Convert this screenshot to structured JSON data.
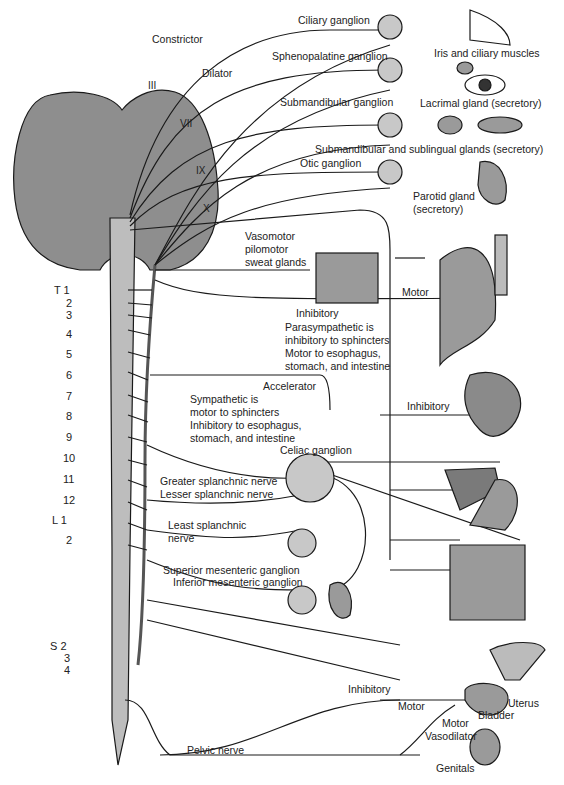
{
  "cranial_nerves": {
    "III": "III",
    "VII": "VII",
    "IX": "IX",
    "X": "X"
  },
  "labels": {
    "constrictor": "Constrictor",
    "dilator": "Dilator",
    "ciliary_ganglion": "Ciliary ganglion",
    "iris": "Iris and ciliary muscles",
    "sphenopalatine": "Sphenopalatine ganglion",
    "lacrimal": "Lacrimal gland (secretory)",
    "submandibular_ganglion": "Submandibular ganglion",
    "submandibular_glands": "Submandibular and sublingual glands (secretory)",
    "otic": "Otic ganglion",
    "parotid1": "Parotid gland",
    "parotid2": "(secretory)",
    "vaso1": "Vasomotor",
    "vaso2": "pilomotor",
    "vaso3": "sweat glands",
    "motor_lung": "Motor",
    "inhibitory_lung": "Inhibitory",
    "para1": "Parasympathetic is",
    "para2": "inhibitory to sphincters",
    "para3": "Motor to esophagus,",
    "para4": "stomach, and intestine",
    "accelerator": "Accelerator",
    "inhibitory_heart": "Inhibitory",
    "symp1": "Sympathetic is",
    "symp2": "motor to sphincters",
    "symp3": "Inhibitory to esophagus,",
    "symp4": "stomach, and intestine",
    "celiac": "Celiac ganglion",
    "greater": "Greater splanchnic nerve",
    "lesser": "Lesser splanchnic nerve",
    "least1": "Least splanchnic",
    "least2": "nerve",
    "sup_mes": "Superior mesenteric ganglion",
    "inf_mes": "Inferior mesenteric ganglion",
    "inhibitory_bladder": "Inhibitory",
    "motor_bladder": "Motor",
    "uterus": "Uterus",
    "bladder": "Bladder",
    "motor_gen": "Motor",
    "vasodilator": "Vasodilator",
    "genitals": "Genitals",
    "pelvic": "Pelvic nerve"
  },
  "segments": {
    "T1": "T 1",
    "T2": "2",
    "T3": "3",
    "T4": "4",
    "T5": "5",
    "T6": "6",
    "T7": "7",
    "T8": "8",
    "T9": "9",
    "T10": "10",
    "T11": "11",
    "T12": "12",
    "L1": "L 1",
    "L2": "2",
    "S2": "S 2",
    "S3": "3",
    "S4": "4"
  },
  "colors": {
    "organ": "#9a9a9a",
    "ganglion": "#c8c8c8",
    "cord": "#bdbdbd",
    "line": "#1a1a1a"
  }
}
